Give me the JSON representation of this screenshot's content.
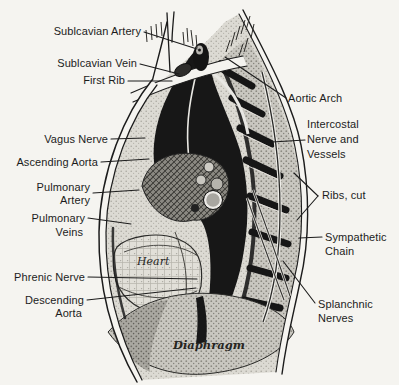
{
  "colors": {
    "paper": "#f5f4f0",
    "ink": "#1c1c1c"
  },
  "labels": {
    "subclavian_artery": "Sublcavian Artery",
    "subclavian_vein": "Sublcavian Vein",
    "first_rib": "First Rib",
    "vagus_nerve": "Vagus Nerve",
    "ascending_aorta": "Ascending Aorta",
    "pulmonary_artery": [
      "Pulmonary",
      "Artery"
    ],
    "pulmonary_veins": [
      "Pulmonary",
      "Veins"
    ],
    "phrenic_nerve": "Phrenic Nerve",
    "descending_aorta": [
      "Descending",
      "Aorta"
    ],
    "aortic_arch": "Aortic Arch",
    "intercostal_nerve_and_vessels": [
      "Intercostal",
      "Nerve and",
      "Vessels"
    ],
    "ribs_cut": "Ribs, cut",
    "sympathetic_chain": [
      "Sympathetic",
      "Chain"
    ],
    "splanchnic_nerves": [
      "Splanchnic",
      "Nerves"
    ],
    "heart": "Heart",
    "diaphragm": "Diaphragm"
  }
}
